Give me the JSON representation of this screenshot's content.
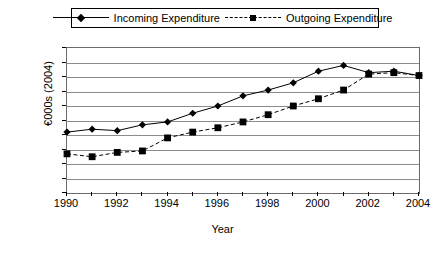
{
  "legend": {
    "incoming_label": "Incoming Expenditure",
    "outgoing_label": "Outgoing Expenditure"
  },
  "axes": {
    "ylabel": "€000s (2004)",
    "xlabel": "Year"
  },
  "chart_data": {
    "type": "line",
    "title": "",
    "xlabel": "Year",
    "ylabel": "€000s (2004)",
    "x": [
      1990,
      1991,
      1992,
      1993,
      1994,
      1995,
      1996,
      1997,
      1998,
      1999,
      2000,
      2001,
      2002,
      2003,
      2004
    ],
    "xlim": [
      1990,
      2004
    ],
    "ylim": [
      0,
      5000
    ],
    "ytick_labels": [
      "0",
      "500",
      "1000",
      "1500",
      "2000",
      "2500",
      "3000",
      "3500",
      "4000",
      "4500",
      "5000"
    ],
    "yticks": [
      0,
      500,
      1000,
      1500,
      2000,
      2500,
      3000,
      3500,
      4000,
      4500,
      5000
    ],
    "xtick_labels": [
      "1990",
      "1992",
      "1994",
      "1996",
      "1998",
      "2000",
      "2002",
      "2004"
    ],
    "xticks": [
      1990,
      1992,
      1994,
      1996,
      1998,
      2000,
      2002,
      2004
    ],
    "grid": "horizontal",
    "legend_position": "top",
    "series": [
      {
        "name": "Incoming Expenditure",
        "marker": "diamond",
        "linestyle": "solid",
        "color": "#000000",
        "values": [
          2100,
          2200,
          2150,
          2350,
          2450,
          2750,
          3000,
          3350,
          3550,
          3800,
          4200,
          4400,
          4150,
          4200,
          4050
        ]
      },
      {
        "name": "Outgoing Expenditure",
        "marker": "square",
        "linestyle": "dashed",
        "color": "#000000",
        "values": [
          1350,
          1250,
          1400,
          1450,
          1900,
          2100,
          2250,
          2450,
          2700,
          3000,
          3250,
          3550,
          4100,
          4150,
          4050
        ]
      }
    ]
  }
}
